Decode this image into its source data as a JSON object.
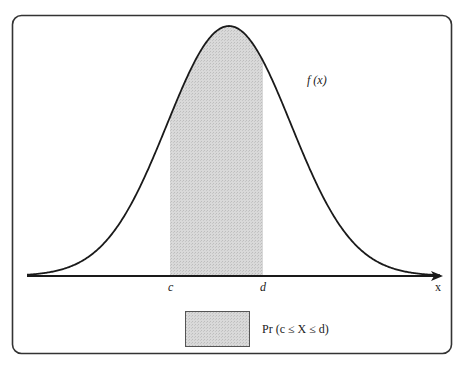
{
  "figure": {
    "curve_label": "f (x)",
    "axis_label": "x",
    "lower_bound_label": "c",
    "upper_bound_label": "d",
    "legend_text": "Pr (c ≤ X ≤ d)",
    "colors": {
      "frame": "#333333",
      "curve": "#1a1a1a",
      "shade": "#d4d4d4",
      "shade_border": "#555555"
    }
  },
  "chart_data": {
    "type": "area",
    "title": "",
    "curve": {
      "name": "f(x)",
      "distribution": "normal",
      "center_px": 229,
      "sigma_px": 62,
      "peak_y_px": 26,
      "baseline_y_px": 276
    },
    "x_range_px": [
      27,
      440
    ],
    "shaded_interval": {
      "from_label": "c",
      "to_label": "d",
      "from_px": 170,
      "to_px": 263
    },
    "xlabel": "x",
    "ylabel": "",
    "legend": [
      {
        "swatch": "shaded",
        "label": "Pr (c ≤ X ≤ d)"
      }
    ],
    "grid": false
  }
}
